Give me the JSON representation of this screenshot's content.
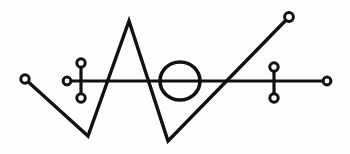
{
  "figure": {
    "kind": "line-diagram",
    "width": 350,
    "height": 154,
    "background_color": "#fefefe",
    "ink_color": "#111111",
    "node_fill_color": "#ffffff"
  },
  "chart_data": {
    "type": "scatter",
    "xlabel": "",
    "ylabel": "",
    "xlim": [
      0,
      350
    ],
    "ylim": [
      0,
      154
    ],
    "grid": false,
    "legend": null,
    "series": [
      {
        "name": "zigzag-path",
        "kind": "polyline",
        "stroke_width": 3.4,
        "x": [
          25,
          88,
          129,
          168,
          289
        ],
        "y": [
          79,
          136,
          21,
          141,
          17
        ]
      },
      {
        "name": "horizontal-axis",
        "kind": "polyline",
        "stroke_width": 3.2,
        "x": [
          67,
          327
        ],
        "y": [
          81,
          81
        ]
      },
      {
        "name": "left-cross-bar",
        "kind": "polyline",
        "stroke_width": 3.2,
        "x": [
          81,
          81
        ],
        "y": [
          63,
          98
        ]
      },
      {
        "name": "right-cross-bar",
        "kind": "polyline",
        "stroke_width": 3.2,
        "x": [
          274,
          274
        ],
        "y": [
          67,
          98
        ]
      }
    ],
    "ellipses": [
      {
        "name": "central-ellipse",
        "cx": 180,
        "cy": 81,
        "rx": 20,
        "ry": 19,
        "stroke_width": 3.6
      }
    ],
    "nodes": [
      {
        "name": "left-terminal-node",
        "cx": 25,
        "cy": 79,
        "r": 4.2
      },
      {
        "name": "axis-left-terminal-node",
        "cx": 67,
        "cy": 81,
        "r": 3.9
      },
      {
        "name": "left-cross-top-node",
        "cx": 81,
        "cy": 63,
        "r": 4.2
      },
      {
        "name": "left-cross-bottom-node",
        "cx": 81,
        "cy": 98,
        "r": 4.2
      },
      {
        "name": "right-cross-top-node",
        "cx": 274,
        "cy": 67,
        "r": 4.2
      },
      {
        "name": "right-cross-bottom-node",
        "cx": 274,
        "cy": 98,
        "r": 4.2
      },
      {
        "name": "axis-right-terminal-node",
        "cx": 327,
        "cy": 81,
        "r": 3.9
      },
      {
        "name": "upper-right-terminal-node",
        "cx": 289,
        "cy": 17,
        "r": 4.4
      }
    ],
    "vertices": [
      {
        "name": "left-start",
        "x": 25,
        "y": 79
      },
      {
        "name": "lower-left-valley",
        "x": 88,
        "y": 136
      },
      {
        "name": "central-peak",
        "x": 129,
        "y": 21
      },
      {
        "name": "lower-right-valley",
        "x": 168,
        "y": 141
      },
      {
        "name": "upper-right-end",
        "x": 289,
        "y": 17
      }
    ]
  }
}
